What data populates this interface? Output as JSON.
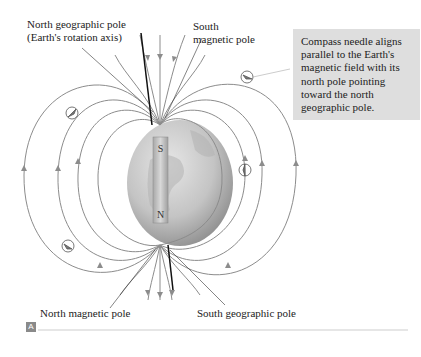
{
  "figure": {
    "labels": {
      "north_geographic_pole": [
        "North geographic pole",
        "(Earth's rotation axis)"
      ],
      "south_magnetic_pole": [
        "South",
        "magnetic pole"
      ],
      "north_magnetic_pole": "North magnetic pole",
      "south_geographic_pole": "South geographic pole"
    },
    "magnet": {
      "top_pole": "S",
      "bottom_pole": "N"
    },
    "callout": "Compass needle aligns parallel to the Earth's magnetic field with its north pole pointing toward the north geographic pole.",
    "panel_label": "A",
    "colors": {
      "field_line": "#8c8c8c",
      "axis": "#111111",
      "globe_light": "#d9d9d9",
      "globe_dark": "#9a9a9a",
      "callout_bg": "#dedede"
    }
  }
}
